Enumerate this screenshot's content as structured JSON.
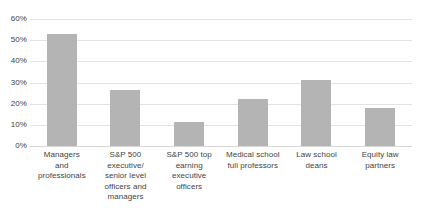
{
  "chart_data": {
    "type": "bar",
    "title": "",
    "xlabel": "",
    "ylabel": "",
    "ylim": [
      0,
      60
    ],
    "grid": true,
    "legend": null,
    "y_tick_labels": [
      "60%",
      "50%",
      "40%",
      "30%",
      "20%",
      "10%",
      "0%"
    ],
    "y_tick_values": [
      60,
      50,
      40,
      30,
      20,
      10,
      0
    ],
    "bar_color": "#b4b4b4",
    "gridline_color": "#e3e3e3",
    "text_color": "#434343",
    "categories": [
      "Managers and professionals",
      "S&P 500 executive/ senior level officers and managers",
      "S&P 500 top earning executive officers",
      "Medical school full professors",
      "Law school deans",
      "Equity law partners"
    ],
    "category_lines": [
      [
        "Managers",
        "and",
        "professionals"
      ],
      [
        "S&P 500",
        "executive/",
        "senior level",
        "officers and",
        "managers"
      ],
      [
        "S&P 500 top",
        "earning",
        "executive",
        "officers"
      ],
      [
        "Medical school",
        "full professors"
      ],
      [
        "Law school",
        "deans"
      ],
      [
        "Equity law",
        "partners"
      ]
    ],
    "values": [
      53,
      26.5,
      11.5,
      22,
      31,
      18
    ]
  }
}
